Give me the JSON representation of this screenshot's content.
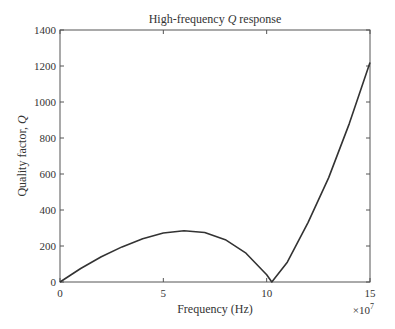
{
  "chart_data": {
    "type": "line",
    "title": "High-frequency Q response",
    "xlabel": "Frequency (Hz)",
    "ylabel": "Quality factor, Q",
    "x_multiplier": "×10^7",
    "xlim": [
      0,
      15
    ],
    "ylim": [
      0,
      1400
    ],
    "xticks": [
      0,
      5,
      10,
      15
    ],
    "yticks": [
      0,
      200,
      400,
      600,
      800,
      1000,
      1200,
      1400
    ],
    "grid": false,
    "legend": null,
    "series": [
      {
        "name": "Q",
        "x": [
          0,
          1,
          2,
          3,
          4,
          5,
          6,
          7,
          8,
          9,
          10,
          10.25,
          11,
          12,
          13,
          14,
          15
        ],
        "y": [
          0,
          75,
          140,
          195,
          240,
          272,
          285,
          275,
          235,
          160,
          40,
          0,
          110,
          330,
          580,
          880,
          1220
        ]
      }
    ]
  },
  "labels": {
    "title_pre": "High-frequency ",
    "title_q": "Q",
    "title_post": " response",
    "xlabel": "Frequency (Hz)",
    "ylabel_pre": "Quality factor, ",
    "ylabel_q": "Q",
    "multiplier_base": "×10",
    "multiplier_exp": "7"
  }
}
